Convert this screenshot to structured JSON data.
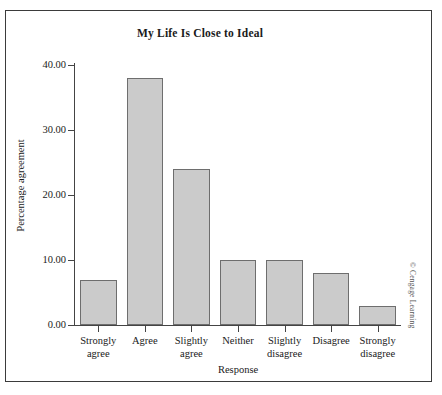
{
  "figure": {
    "credit": "© Cengage Learning"
  },
  "chart_data": {
    "type": "bar",
    "title": "My Life Is Close to Ideal",
    "xlabel": "Response",
    "ylabel": "Percentage agreement",
    "categories": [
      "Strongly agree",
      "Agree",
      "Slightly agree",
      "Neither",
      "Slightly disagree",
      "Disagree",
      "Strongly disagree"
    ],
    "category_lines": [
      [
        "Strongly",
        "agree"
      ],
      [
        "Agree",
        ""
      ],
      [
        "Slightly",
        "agree"
      ],
      [
        "Neither",
        ""
      ],
      [
        "Slightly",
        "disagree"
      ],
      [
        "Disagree",
        ""
      ],
      [
        "Strongly",
        "disagree"
      ]
    ],
    "values": [
      7,
      38,
      24,
      10,
      10,
      8,
      3
    ],
    "ylim": [
      0,
      40
    ],
    "ytick_labels": [
      "0.00",
      "10.00",
      "20.00",
      "30.00",
      "40.00"
    ],
    "ytick_values": [
      0,
      10,
      20,
      30,
      40
    ],
    "grid": false,
    "legend": false,
    "bar_fill": "#cbcbcb",
    "bar_border": "#6e6e6e"
  }
}
